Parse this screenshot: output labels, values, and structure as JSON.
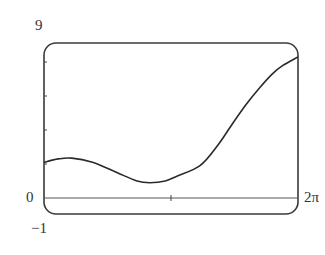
{
  "chart_data": {
    "type": "line",
    "title": "",
    "xlabel": "",
    "ylabel": "",
    "xlim": [
      0,
      6.2832
    ],
    "ylim": [
      -1,
      9
    ],
    "x_tick_labels": [
      "0",
      "2π"
    ],
    "y_tick_labels": [
      "9",
      "0",
      "−1"
    ],
    "y_minor_ticks": [
      2,
      4,
      6,
      8
    ],
    "x_minor_ticks": [
      3.1416
    ],
    "grid": false,
    "legend": null,
    "series": [
      {
        "name": "f(x)",
        "x": [
          0,
          0.35,
          0.69,
          1.2,
          1.8,
          2.3,
          2.62,
          3.0,
          3.3,
          3.86,
          4.3,
          4.67,
          5.0,
          5.34,
          5.65,
          5.91,
          6.2832
        ],
        "y": [
          2.1,
          2.3,
          2.35,
          2.1,
          1.5,
          1.0,
          0.9,
          1.0,
          1.3,
          1.9,
          3.1,
          4.4,
          5.5,
          6.5,
          7.3,
          7.8,
          8.3
        ]
      }
    ]
  },
  "labels": {
    "y_top": "9",
    "y_zero": "0",
    "y_bottom": "−1",
    "x_right": "2π"
  }
}
